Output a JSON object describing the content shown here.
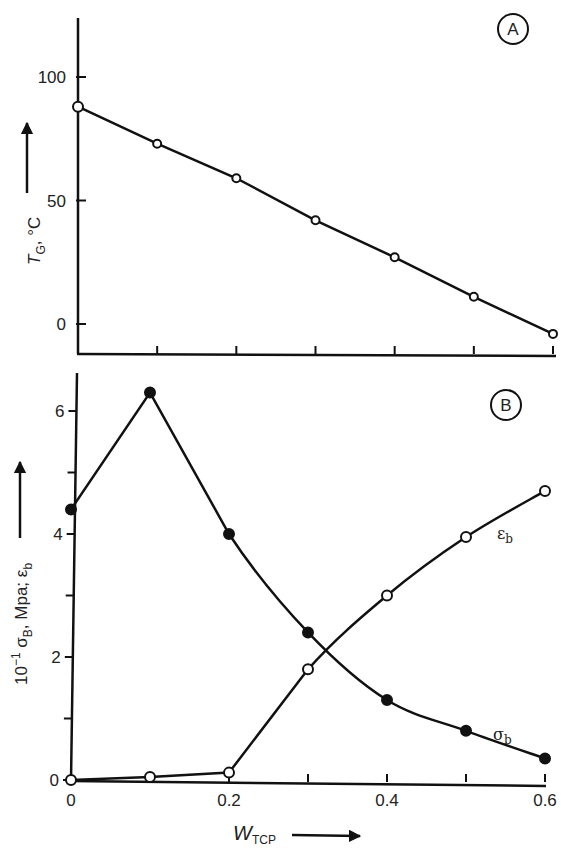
{
  "chart_data": [
    {
      "panel": "A",
      "type": "line",
      "panel_label": "A",
      "ylabel": "T_G, °C",
      "ylabel_main": "T",
      "ylabel_sub": "G",
      "ylabel_unit": ", °C",
      "xlabel": "",
      "ylim": [
        -10,
        120
      ],
      "xlim": [
        0,
        0.6
      ],
      "yticks": [
        0,
        50,
        100
      ],
      "ytick_labels": [
        "0",
        "50",
        "100"
      ],
      "xticks": [
        0.1,
        0.2,
        0.3,
        0.4,
        0.5,
        0.6
      ],
      "grid": false,
      "series": [
        {
          "name": "T_G",
          "marker": "open-circle",
          "x": [
            0,
            0.1,
            0.2,
            0.3,
            0.4,
            0.5,
            0.6
          ],
          "y": [
            88,
            73,
            59,
            42,
            27,
            11,
            -4
          ]
        }
      ]
    },
    {
      "panel": "B",
      "type": "line",
      "panel_label": "B",
      "ylabel": "10^-1 σB, Mpa; εb",
      "ylabel_parts": {
        "prefix": "10",
        "exp": "−1",
        "sigma": " σ",
        "sigma_sub": "B",
        "mid": ", Mpa; ε",
        "eps_sub": "b"
      },
      "xlabel": "W_TCP",
      "xlabel_main": "W",
      "xlabel_sub": "TCP",
      "xlim": [
        0,
        0.6
      ],
      "ylim": [
        -0.1,
        6.6
      ],
      "yticks": [
        0,
        1,
        2,
        3,
        4,
        5,
        6
      ],
      "ytick_labels": [
        "0",
        "",
        "2",
        "",
        "4",
        "",
        "6"
      ],
      "xticks": [
        0,
        0.1,
        0.2,
        0.3,
        0.4,
        0.5,
        0.6
      ],
      "xtick_labels": [
        "0",
        "",
        "0.2",
        "",
        "0.4",
        "",
        "0.6"
      ],
      "grid": false,
      "series": [
        {
          "name": "σb",
          "label": "σ",
          "label_sub": "b",
          "marker": "filled-circle",
          "x": [
            0,
            0.1,
            0.2,
            0.3,
            0.4,
            0.5,
            0.6
          ],
          "y": [
            4.4,
            6.3,
            4.0,
            2.4,
            1.3,
            0.8,
            0.35
          ]
        },
        {
          "name": "εb",
          "label": "ε",
          "label_sub": "b",
          "marker": "open-circle",
          "x": [
            0,
            0.1,
            0.2,
            0.3,
            0.4,
            0.5,
            0.6
          ],
          "y": [
            0.0,
            0.05,
            0.12,
            1.8,
            3.0,
            3.95,
            4.7
          ]
        }
      ]
    }
  ]
}
